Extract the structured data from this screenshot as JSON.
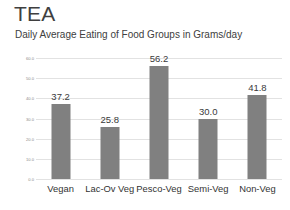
{
  "chart_data": {
    "type": "bar",
    "title": "TEA",
    "subtitle": "Daily Average Eating of Food Groups in Grams/day",
    "categories": [
      "Vegan",
      "Lac-Ov Veg",
      "Pesco-Veg",
      "Semi-Veg",
      "Non-Veg"
    ],
    "values": [
      37.2,
      25.8,
      56.2,
      30.0,
      41.8
    ],
    "value_labels": [
      "37.2",
      "25.8",
      "56.2",
      "30.0",
      "41.8"
    ],
    "xlabel": "",
    "ylabel": "",
    "ylim": [
      0.0,
      60.0
    ],
    "ytick_values": [
      60.0,
      50.0,
      40.0,
      30.0,
      20.0,
      10.0,
      0.0
    ],
    "ytick_labels": [
      "60.0",
      "50.0",
      "40.0",
      "30.0",
      "20.0",
      "10.0",
      "0.0"
    ],
    "grid": true,
    "legend": false,
    "bar_color": "#808080",
    "background_color": "#ffffff",
    "gridline_color": "#e2e2e2"
  }
}
